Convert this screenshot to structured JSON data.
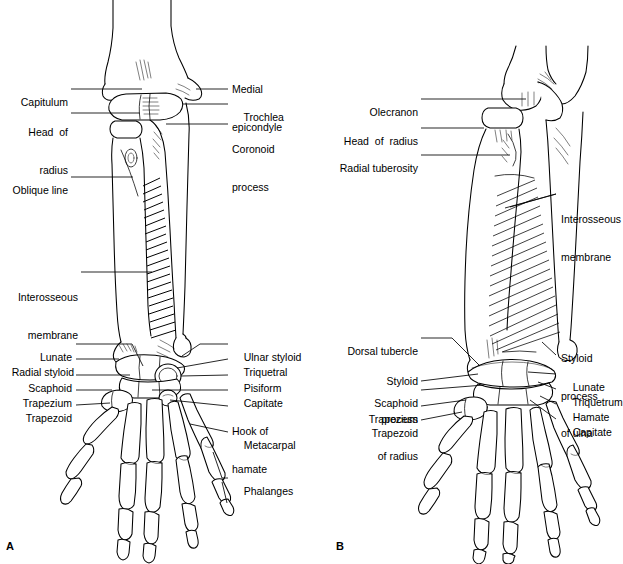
{
  "figure": {
    "title_present": false,
    "panels": [
      {
        "letter": "A",
        "view": "anterior",
        "labels_left": [
          {
            "text": "Capitulum",
            "lines": [
              "Capitulum"
            ]
          },
          {
            "text": "Head of radius",
            "lines": [
              "Head  of",
              "radius"
            ]
          },
          {
            "text": "Oblique line",
            "lines": [
              "Oblique line"
            ]
          },
          {
            "text": "Interosseous membrane",
            "lines": [
              "Interosseous",
              "membrane"
            ]
          },
          {
            "text": "Lunate",
            "lines": [
              "Lunate"
            ]
          },
          {
            "text": "Radial styloid",
            "lines": [
              "Radial styloid"
            ]
          },
          {
            "text": "Scaphoid",
            "lines": [
              "Scaphoid"
            ]
          },
          {
            "text": "Trapezium",
            "lines": [
              "Trapezium"
            ]
          },
          {
            "text": "Trapezoid",
            "lines": [
              "Trapezoid"
            ]
          }
        ],
        "labels_right": [
          {
            "text": "Medial epicondyle",
            "lines": [
              "Medial",
              "epicondyle"
            ]
          },
          {
            "text": "Trochlea",
            "lines": [
              "Trochlea"
            ]
          },
          {
            "text": "Coronoid process",
            "lines": [
              "Coronoid",
              "process"
            ]
          },
          {
            "text": "Ulnar styloid",
            "lines": [
              "Ulnar styloid"
            ]
          },
          {
            "text": "Triquetral",
            "lines": [
              "Triquetral"
            ]
          },
          {
            "text": "Pisiform",
            "lines": [
              "Pisiform"
            ]
          },
          {
            "text": "Capitate",
            "lines": [
              "Capitate"
            ]
          },
          {
            "text": "Hook of hamate",
            "lines": [
              "Hook of",
              "hamate"
            ]
          },
          {
            "text": "Metacarpal",
            "lines": [
              "Metacarpal"
            ]
          },
          {
            "text": "Phalanges",
            "lines": [
              "Phalanges"
            ]
          }
        ]
      },
      {
        "letter": "B",
        "view": "lateral",
        "labels_left": [
          {
            "text": "Olecranon",
            "lines": [
              "Olecranon"
            ]
          },
          {
            "text": "Head of radius",
            "lines": [
              "Head  of  radius"
            ]
          },
          {
            "text": "Radial tuberosity",
            "lines": [
              "Radial tuberosity"
            ]
          },
          {
            "text": "Dorsal tubercle",
            "lines": [
              "Dorsal tubercle"
            ]
          },
          {
            "text": "Styloid process of radius",
            "lines": [
              "Styloid",
              "process",
              "of radius"
            ]
          },
          {
            "text": "Scaphoid",
            "lines": [
              "Scaphoid"
            ]
          },
          {
            "text": "Trapezium",
            "lines": [
              "Trapezium"
            ]
          },
          {
            "text": "Trapezoid",
            "lines": [
              "Trapezoid"
            ]
          }
        ],
        "labels_right": [
          {
            "text": "Interosseous membrane",
            "lines": [
              "Interosseous",
              "membrane"
            ]
          },
          {
            "text": "Styloid process of ulna",
            "lines": [
              "Styloid",
              "process",
              "of ulna"
            ]
          },
          {
            "text": "Lunate",
            "lines": [
              "Lunate"
            ]
          },
          {
            "text": "Triquetrum",
            "lines": [
              "Triquetrum"
            ]
          },
          {
            "text": "Hamate",
            "lines": [
              "Hamate"
            ]
          },
          {
            "text": "Capitate",
            "lines": [
              "Capitate"
            ]
          }
        ]
      }
    ]
  },
  "a": {
    "l0l0": "Capitulum",
    "l1l0": "Head  of",
    "l1l1": "radius",
    "l2l0": "Oblique line",
    "l3l0": "Interosseous",
    "l3l1": "membrane",
    "l4l0": "Lunate",
    "l5l0": "Radial styloid",
    "l6l0": "Scaphoid",
    "l7l0": "Trapezium",
    "l8l0": "Trapezoid",
    "r0l0": "Medial",
    "r0l1": "epicondyle",
    "r1l0": "Trochlea",
    "r2l0": "Coronoid",
    "r2l1": "process",
    "r3l0": "Ulnar styloid",
    "r4l0": "Triquetral",
    "r5l0": "Pisiform",
    "r6l0": "Capitate",
    "r7l0": "Hook of",
    "r7l1": "hamate",
    "r8l0": "Metacarpal",
    "r9l0": "Phalanges",
    "letter": "A"
  },
  "b": {
    "l0l0": "Olecranon",
    "l1l0": "Head  of  radius",
    "l2l0": "Radial tuberosity",
    "l3l0": "Dorsal tubercle",
    "l4l0": "Styloid",
    "l4l1": "process",
    "l4l2": "of radius",
    "l5l0": "Scaphoid",
    "l6l0": "Trapezium",
    "l7l0": "Trapezoid",
    "r0l0": "Interosseous",
    "r0l1": "membrane",
    "r1l0": "Styloid",
    "r1l1": "process",
    "r1l2": "of ulna",
    "r2l0": "Lunate",
    "r3l0": "Triquetrum",
    "r4l0": "Hamate",
    "r5l0": "Capitate",
    "letter": "B"
  },
  "colors": {
    "ink": "#000000",
    "paper": "#ffffff"
  }
}
